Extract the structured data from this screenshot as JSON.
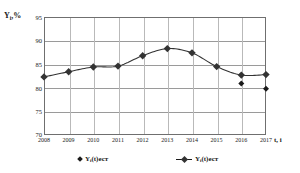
{
  "chart_data": {
    "type": "line",
    "title": "",
    "xlabel": "t, i",
    "ylabel": "Yi,%",
    "ylabel_base": "Y",
    "ylabel_sub": "i",
    "ylabel_suffix": ",%",
    "x": [
      2008,
      2009,
      2010,
      2011,
      2012,
      2013,
      2014,
      2015,
      2016,
      2017
    ],
    "categories": [
      "2008",
      "2009",
      "2010",
      "2011",
      "2012",
      "2013",
      "2014",
      "2015",
      "2016",
      "2017"
    ],
    "ylim": [
      70,
      95
    ],
    "yticks": [
      95,
      90,
      85,
      80,
      75,
      70
    ],
    "ytick_labels": [
      "95",
      "90",
      "85",
      "80",
      "75",
      "70"
    ],
    "grid": true,
    "legend_position": "bottom",
    "series": [
      {
        "name": "Yi(t)ест",
        "name_base": "Y",
        "name_sub": "i",
        "name_suffix": "(t)ест",
        "marker": "diamond",
        "line": false,
        "color": "#1a1a1a",
        "x": [
          2016,
          2017
        ],
        "values": [
          80.9,
          79.8
        ]
      },
      {
        "name": "Yi(t)ест",
        "name_base": "Y",
        "name_sub": "i",
        "name_suffix": "(t)ест",
        "marker": "square",
        "line": true,
        "color": "#333333",
        "x": [
          2008,
          2009,
          2010,
          2011,
          2012,
          2013,
          2014,
          2015,
          2016,
          2017
        ],
        "values": [
          82.3,
          83.4,
          84.4,
          84.6,
          86.8,
          88.3,
          87.4,
          84.5,
          82.7,
          82.8
        ]
      }
    ]
  }
}
